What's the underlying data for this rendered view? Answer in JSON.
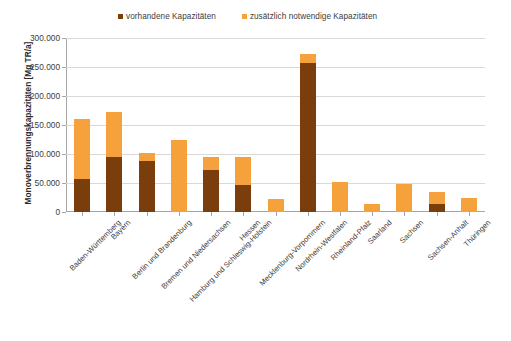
{
  "chart_data": {
    "type": "bar",
    "title": "",
    "subtitle": "",
    "xlabel": "",
    "ylabel": "Monoverbrennungskapazitäten [Mg TR/a]",
    "ylim": [
      0,
      300000
    ],
    "ytick_labels": [
      "300.000",
      "250.000",
      "200.000",
      "150.000",
      "100.000",
      "50.000",
      "0"
    ],
    "ytick_values": [
      300000,
      250000,
      200000,
      150000,
      100000,
      50000,
      0
    ],
    "grid": true,
    "stacked": true,
    "legend_position": "top",
    "categories": [
      "Baden-Württemberg",
      "Bayern",
      "Berlin und Brandenburg",
      "Bremen und Niedersachsen",
      "Hamburg und Schleswig-Holstein",
      "Hessen",
      "Mecklenburg-Vorpommern",
      "Nordrhein-Westfalen",
      "Rheinland-Pfalz",
      "Saarland",
      "Sachsen",
      "Sachsen-Anhalt",
      "Thüringen"
    ],
    "series": [
      {
        "name": "vorhandene Kapazitäten",
        "color": "#7A3E0C",
        "values": [
          57000,
          95000,
          88000,
          0,
          72000,
          46000,
          0,
          257000,
          0,
          0,
          0,
          14000,
          0
        ]
      },
      {
        "name": "zusätzlich notwendige Kapazitäten",
        "color": "#F5A13C",
        "values": [
          103000,
          78000,
          14000,
          125000,
          23000,
          49000,
          22000,
          15000,
          52000,
          13000,
          49000,
          20000,
          24000
        ]
      }
    ],
    "totals": [
      160000,
      173000,
      102000,
      125000,
      95000,
      95000,
      22000,
      272000,
      52000,
      13000,
      49000,
      34000,
      24000
    ]
  },
  "legend": {
    "entries": [
      {
        "label": "vorhandene Kapazitäten",
        "color": "#7A3E0C"
      },
      {
        "label": "zusätzlich notwendige Kapazitäten",
        "color": "#F5A13C"
      }
    ]
  },
  "axes": {
    "y_title": "Monoverbrennungskapazitäten [Mg TR/a]"
  },
  "colors": {
    "existing": "#7A3E0C",
    "additional": "#F5A13C",
    "grid": "#d9d9d9",
    "axis": "#a6a6a6",
    "text": "#3d3d3d",
    "background": "#ffffff"
  }
}
